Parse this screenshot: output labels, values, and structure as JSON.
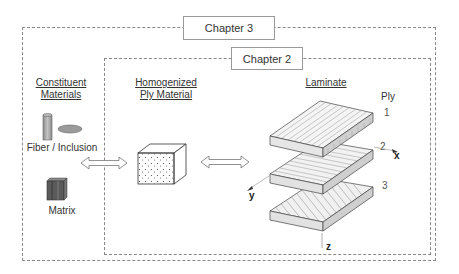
{
  "chapters": {
    "outer": {
      "label": "Chapter 3"
    },
    "inner": {
      "label": "Chapter 2"
    }
  },
  "sections": {
    "constituent": {
      "title_line1": "Constituent",
      "title_line2": "Materials"
    },
    "homogenized": {
      "title_line1": "Homogenized",
      "title_line2": "Ply Material"
    },
    "laminate": {
      "title": "Laminate"
    }
  },
  "labels": {
    "fiber": "Fiber / Inclusion",
    "matrix": "Matrix",
    "ply_header": "Ply"
  },
  "plies": [
    {
      "number": "1",
      "fiber_orientation": "0°"
    },
    {
      "number": "2",
      "fiber_orientation": "90°"
    },
    {
      "number": "3",
      "fiber_orientation": "45°"
    }
  ],
  "axes": {
    "x": "x",
    "y": "y",
    "z": "z"
  },
  "icons": {
    "fiber": "cylinder-icon",
    "inclusion": "ellipse-icon",
    "matrix": "matrix-block-icon",
    "homogenized": "dotted-cube-icon",
    "arrows": "double-arrow-icon"
  },
  "colors": {
    "dashed_border": "#888888",
    "fiber_fill": "#a0a0a0",
    "matrix_fill": "#5a5a5a",
    "ply_face": "#f4f4f4"
  }
}
